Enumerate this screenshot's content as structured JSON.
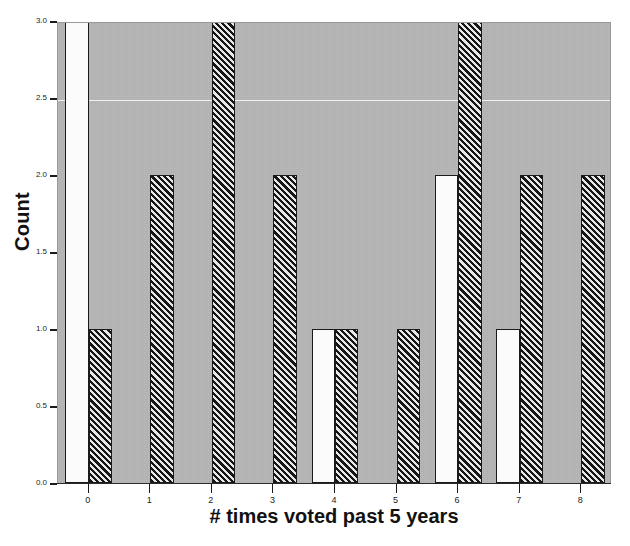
{
  "chart_data": {
    "type": "bar",
    "title": "",
    "xlabel": "# times voted past 5 years",
    "ylabel": "Count",
    "categories": [
      "0",
      "1",
      "2",
      "3",
      "4",
      "5",
      "6",
      "7",
      "8"
    ],
    "series": [
      {
        "name": "white",
        "fill": "white",
        "values": [
          3,
          0,
          0,
          0,
          1,
          0,
          2,
          1,
          0
        ]
      },
      {
        "name": "hatched",
        "fill": "diagonal-hatch",
        "values": [
          1,
          2,
          3,
          2,
          1,
          1,
          3,
          2,
          2
        ]
      }
    ],
    "ylim": [
      0,
      3
    ],
    "yticks": [
      "0.0",
      "0.5",
      "1.0",
      "1.5",
      "2.0",
      "2.5",
      "3.0"
    ],
    "ytick_values": [
      0,
      0.5,
      1,
      1.5,
      2,
      2.5,
      3
    ],
    "xticks": [
      "0",
      "1",
      "2",
      "3",
      "4",
      "5",
      "6",
      "7",
      "8"
    ],
    "gridlines": [
      2.5
    ],
    "grid": true,
    "legend": "none",
    "plot_background": "#b0b0b0",
    "bar_outline_color": "#1a1a1a",
    "gridline_color": "#f2f2f2",
    "text_color": "#111111"
  }
}
